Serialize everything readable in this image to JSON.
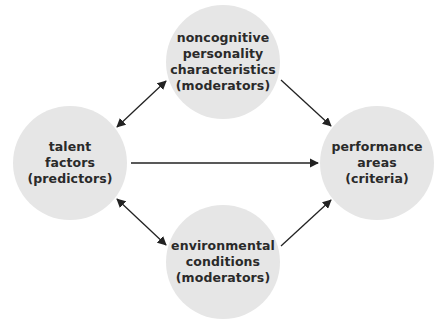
{
  "diagram": {
    "fill_color": "#e6e6e6",
    "arrow_color": "#222222",
    "nodes": {
      "top": {
        "lines": [
          "noncognitive",
          "personality",
          "characteristics",
          "(moderators)"
        ]
      },
      "left": {
        "lines": [
          "talent",
          "factors",
          "(predictors)"
        ]
      },
      "right": {
        "lines": [
          "performance",
          "areas",
          "(criteria)"
        ]
      },
      "bottom": {
        "lines": [
          "environmental",
          "conditions",
          "(moderators)"
        ]
      }
    },
    "edges": [
      {
        "from": "left",
        "to": "top",
        "direction": "bidirectional"
      },
      {
        "from": "left",
        "to": "bottom",
        "direction": "bidirectional"
      },
      {
        "from": "left",
        "to": "right",
        "direction": "forward"
      },
      {
        "from": "top",
        "to": "right",
        "direction": "forward"
      },
      {
        "from": "bottom",
        "to": "right",
        "direction": "forward"
      }
    ]
  }
}
